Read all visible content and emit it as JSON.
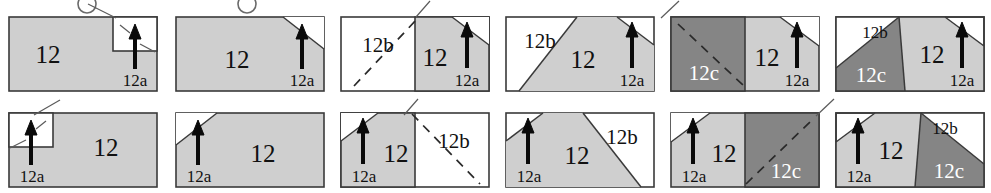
{
  "figure": {
    "title": "",
    "label_main": "12",
    "label_a": "12a",
    "label_b": "12b",
    "label_c": "12c",
    "colors": {
      "region_main": "#cfcfcf",
      "region_a": "#ffffff",
      "region_b": "#ffffff",
      "region_c": "#858585",
      "outline": "#3a3a3a",
      "text": "#111111",
      "text_on_dark": "#ffffff",
      "background": "#ffffff"
    },
    "rows": [
      {
        "row_index": 1,
        "panels": [
          {
            "id": "r1p1",
            "labels": [
              "12",
              "12a"
            ],
            "regions": [
              "main",
              "a"
            ],
            "a_shape": "rectangular-notch-top-right",
            "has_marker_circle": true,
            "has_dashed_line": false
          },
          {
            "id": "r1p2",
            "labels": [
              "12",
              "12a"
            ],
            "regions": [
              "main",
              "a"
            ],
            "a_shape": "corner-triangle-top-right",
            "has_marker_circle": true,
            "has_dashed_line": false
          },
          {
            "id": "r1p3",
            "labels": [
              "12b",
              "12",
              "12a"
            ],
            "regions": [
              "b",
              "main",
              "a"
            ],
            "a_shape": "corner-triangle-top-right",
            "b_shape": "vertical-split-left",
            "has_marker_circle": false,
            "has_dashed_line": true
          },
          {
            "id": "r1p4",
            "labels": [
              "12b",
              "12",
              "12a"
            ],
            "regions": [
              "b",
              "main",
              "a"
            ],
            "a_shape": "corner-triangle-top-right",
            "b_shape": "diagonal-left",
            "has_marker_circle": false,
            "has_dashed_line": false
          },
          {
            "id": "r1p5",
            "labels": [
              "12c",
              "12",
              "12a"
            ],
            "regions": [
              "c",
              "main",
              "a"
            ],
            "a_shape": "corner-triangle-top-right",
            "c_shape": "vertical-split-left",
            "has_marker_circle": false,
            "has_dashed_line": true
          },
          {
            "id": "r1p6",
            "labels": [
              "12b",
              "12c",
              "12",
              "12a"
            ],
            "regions": [
              "b",
              "c",
              "main",
              "a"
            ],
            "a_shape": "corner-triangle-top-right",
            "b_shape": "triangle-top-left",
            "c_shape": "triangle-bottom-left",
            "has_marker_circle": false,
            "has_dashed_line": false
          }
        ]
      },
      {
        "row_index": 2,
        "panels": [
          {
            "id": "r2p1",
            "labels": [
              "12a",
              "12"
            ],
            "regions": [
              "a",
              "main"
            ],
            "a_shape": "rectangular-notch-top-left",
            "has_marker_circle": false,
            "has_dashed_line": false
          },
          {
            "id": "r2p2",
            "labels": [
              "12a",
              "12"
            ],
            "regions": [
              "a",
              "main"
            ],
            "a_shape": "corner-triangle-top-left",
            "has_marker_circle": false,
            "has_dashed_line": false
          },
          {
            "id": "r2p3",
            "labels": [
              "12a",
              "12",
              "12b"
            ],
            "regions": [
              "a",
              "main",
              "b"
            ],
            "a_shape": "corner-triangle-top-left",
            "b_shape": "vertical-split-right",
            "has_marker_circle": false,
            "has_dashed_line": true
          },
          {
            "id": "r2p4",
            "labels": [
              "12a",
              "12",
              "12b"
            ],
            "regions": [
              "a",
              "main",
              "b"
            ],
            "a_shape": "corner-triangle-top-left",
            "b_shape": "diagonal-right",
            "has_marker_circle": false,
            "has_dashed_line": false
          },
          {
            "id": "r2p5",
            "labels": [
              "12a",
              "12",
              "12c"
            ],
            "regions": [
              "a",
              "main",
              "c"
            ],
            "a_shape": "corner-triangle-top-left",
            "c_shape": "vertical-split-right",
            "has_marker_circle": false,
            "has_dashed_line": true
          },
          {
            "id": "r2p6",
            "labels": [
              "12a",
              "12",
              "12b",
              "12c"
            ],
            "regions": [
              "a",
              "main",
              "b",
              "c"
            ],
            "a_shape": "corner-triangle-top-left",
            "b_shape": "triangle-top-right",
            "c_shape": "triangle-bottom-right",
            "has_marker_circle": false,
            "has_dashed_line": false
          }
        ]
      }
    ]
  }
}
